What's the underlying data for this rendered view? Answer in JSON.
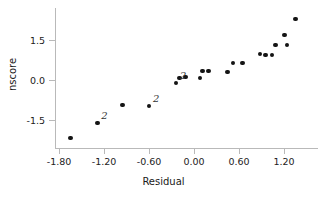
{
  "chart_data": {
    "type": "scatter",
    "title": "",
    "xlabel": "Residual",
    "ylabel": "nscore",
    "xlim": [
      -1.95,
      1.5
    ],
    "ylim": [
      -2.65,
      2.65
    ],
    "grid": false,
    "legend": null,
    "xticks": [
      -1.8,
      -1.2,
      -0.6,
      0.0,
      0.6,
      1.2
    ],
    "xticklabels": [
      "-1.80",
      "-1.20",
      "-0.60",
      "0.00",
      "0.60",
      "1.20"
    ],
    "yticks": [
      1.5,
      0.0,
      -1.5
    ],
    "yticklabels": [
      "1.5",
      "0.0",
      "-1.5"
    ],
    "marker": "filled-circle",
    "marker_color": "#141414",
    "points": [
      {
        "x": -1.65,
        "y": -2.17,
        "label": ""
      },
      {
        "x": -1.29,
        "y": -1.61,
        "label": "2"
      },
      {
        "x": -0.95,
        "y": -0.94,
        "label": ""
      },
      {
        "x": -0.6,
        "y": -0.98,
        "label": "2"
      },
      {
        "x": -0.24,
        "y": -0.11,
        "label": "2"
      },
      {
        "x": -0.19,
        "y": 0.08,
        "label": ""
      },
      {
        "x": -0.11,
        "y": 0.11,
        "label": ""
      },
      {
        "x": 0.08,
        "y": 0.07,
        "label": ""
      },
      {
        "x": 0.11,
        "y": 0.34,
        "label": ""
      },
      {
        "x": 0.19,
        "y": 0.34,
        "label": ""
      },
      {
        "x": 0.45,
        "y": 0.3,
        "label": ""
      },
      {
        "x": 0.52,
        "y": 0.64,
        "label": ""
      },
      {
        "x": 0.65,
        "y": 0.64,
        "label": ""
      },
      {
        "x": 0.88,
        "y": 0.98,
        "label": ""
      },
      {
        "x": 0.95,
        "y": 0.94,
        "label": ""
      },
      {
        "x": 1.04,
        "y": 0.94,
        "label": ""
      },
      {
        "x": 1.09,
        "y": 1.31,
        "label": ""
      },
      {
        "x": 1.24,
        "y": 1.31,
        "label": ""
      },
      {
        "x": 1.21,
        "y": 1.69,
        "label": ""
      },
      {
        "x": 1.35,
        "y": 2.29,
        "label": ""
      }
    ],
    "duplicate_markers": [
      {
        "text": "2",
        "x": -1.29,
        "y": -1.61
      },
      {
        "text": "2",
        "x": -0.6,
        "y": -0.98
      },
      {
        "text": "2",
        "x": -0.24,
        "y": -0.11
      }
    ],
    "axis_color": "#b9b9b9"
  }
}
